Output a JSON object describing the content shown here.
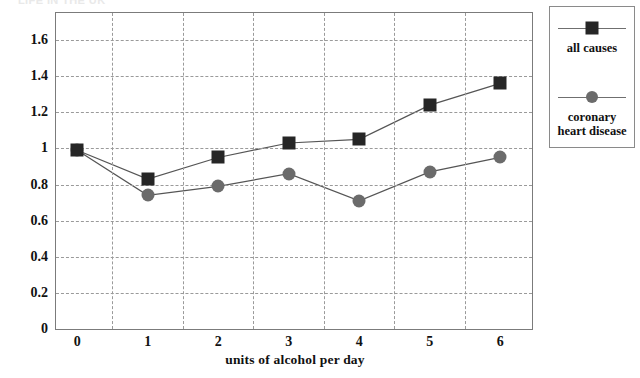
{
  "clipped_heading": "LIFE IN THE UK",
  "chart_data": {
    "type": "line",
    "title": "",
    "xlabel": "units of alcohol per day",
    "ylabel": "",
    "x": [
      0,
      1,
      2,
      3,
      4,
      5,
      6
    ],
    "xticklabels": [
      "0",
      "1",
      "2",
      "3",
      "4",
      "5",
      "6"
    ],
    "yticklabels": [
      "0",
      "0.2",
      "0.4",
      "0.6",
      "0.8",
      "1",
      "1.2",
      "1.4",
      "1.6"
    ],
    "yticks": [
      0,
      0.2,
      0.4,
      0.6,
      0.8,
      1,
      1.2,
      1.4,
      1.6
    ],
    "ylim": [
      0,
      1.75
    ],
    "xlim": [
      -0.3,
      6.45
    ],
    "grid": true,
    "legend_position": "right-outside",
    "series": [
      {
        "name": "all causes",
        "marker": "square",
        "color": "#262626",
        "values": [
          0.99,
          0.83,
          0.95,
          1.03,
          1.05,
          1.24,
          1.36
        ]
      },
      {
        "name": "coronary heart disease",
        "marker": "circle",
        "color": "#6b6b6b",
        "values": [
          0.99,
          0.74,
          0.79,
          0.86,
          0.71,
          0.87,
          0.95
        ]
      }
    ]
  },
  "legend": {
    "entries": [
      {
        "label": "all causes",
        "marker": "square"
      },
      {
        "label": "coronary heart disease",
        "label_line1": "coronary",
        "label_line2": "heart disease",
        "marker": "circle"
      }
    ]
  }
}
